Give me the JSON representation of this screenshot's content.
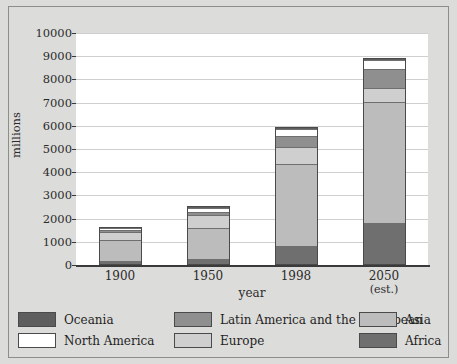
{
  "chart_data": {
    "type": "bar",
    "stacked": true,
    "title": "",
    "subtitle": "",
    "xlabel": "year",
    "ylabel": "millions",
    "categories": [
      "1900",
      "1950",
      "1998",
      "2050"
    ],
    "category_sublabels": [
      "",
      "",
      "",
      "(est.)"
    ],
    "ylim": [
      0,
      10000
    ],
    "ytick_labels": [
      "0",
      "1000",
      "2000",
      "3000",
      "4000",
      "5000",
      "6000",
      "7000",
      "8000",
      "9000",
      "10000"
    ],
    "ytick_values": [
      0,
      1000,
      2000,
      3000,
      4000,
      5000,
      6000,
      7000,
      8000,
      9000,
      10000
    ],
    "grid": true,
    "legend_position": "bottom",
    "stack_order_bottom_to_top": [
      "Africa",
      "Asia",
      "Europe",
      "Latin America and the Caribbean",
      "North America",
      "Oceania"
    ],
    "series": [
      {
        "name": "Africa",
        "color": "#6f6f6f",
        "values": [
          130,
          225,
          780,
          1800
        ]
      },
      {
        "name": "Asia",
        "color": "#bcbcbc",
        "values": [
          950,
          1400,
          3590,
          5270
        ]
      },
      {
        "name": "Europe",
        "color": "#cfcfcf",
        "values": [
          400,
          550,
          730,
          600
        ]
      },
      {
        "name": "Latin America and the Caribbean",
        "color": "#8f8f8f",
        "values": [
          75,
          165,
          500,
          810
        ]
      },
      {
        "name": "North America",
        "color": "#ffffff",
        "values": [
          90,
          170,
          300,
          390
        ]
      },
      {
        "name": "Oceania",
        "color": "#5e5e5e",
        "values": [
          5,
          13,
          30,
          46
        ]
      }
    ],
    "totals": [
      1650,
      2523,
      5930,
      8916
    ]
  },
  "axes": {
    "y_title": "millions",
    "x_title": "year"
  },
  "legend": {
    "items": [
      {
        "label": "Oceania",
        "color": "#5e5e5e"
      },
      {
        "label": "Latin America and the Caribbean",
        "color": "#8f8f8f"
      },
      {
        "label": "Asia",
        "color": "#bcbcbc"
      },
      {
        "label": "North America",
        "color": "#ffffff"
      },
      {
        "label": "Europe",
        "color": "#cfcfcf"
      },
      {
        "label": "Africa",
        "color": "#6f6f6f"
      }
    ]
  }
}
